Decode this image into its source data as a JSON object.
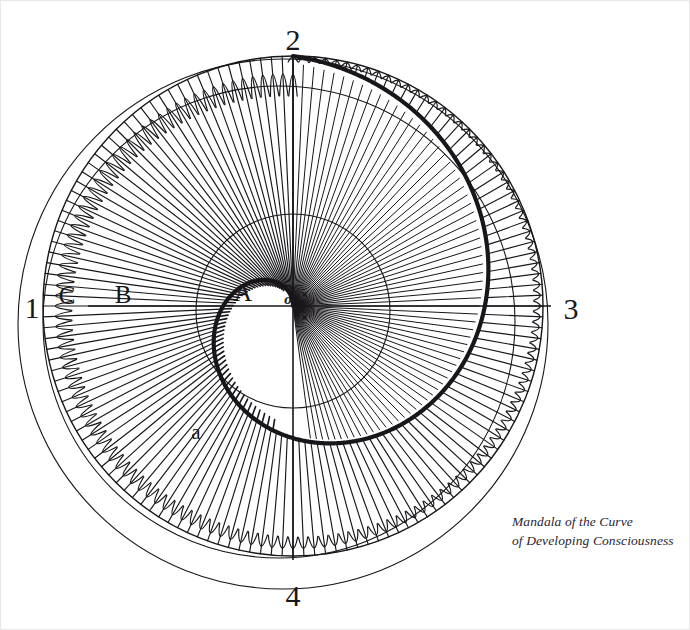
{
  "figure": {
    "title": "Mandala of the Curve of Developing Consciousness",
    "width": 690,
    "height": 630,
    "background_color": "#ffffff",
    "ink_color": "#18161a",
    "frame_color": "#e8e8e8"
  },
  "caption": {
    "line1": "Mandala of the Curve",
    "line2": "of Developing Consciousness"
  },
  "quadrant_labels": [
    {
      "key": "left",
      "text": "1",
      "x": 32,
      "y": 308
    },
    {
      "key": "top",
      "text": "2",
      "x": 293,
      "y": 40
    },
    {
      "key": "right",
      "text": "3",
      "x": 571,
      "y": 309
    },
    {
      "key": "bottom",
      "text": "4",
      "x": 293,
      "y": 596
    }
  ],
  "point_labels": [
    {
      "key": "C",
      "text": "C",
      "x": 67,
      "y": 295
    },
    {
      "key": "B",
      "text": "B",
      "x": 123,
      "y": 294
    },
    {
      "key": "A",
      "text": "A",
      "x": 243,
      "y": 292
    },
    {
      "key": "o",
      "text": "o",
      "x": 288,
      "y": 299
    },
    {
      "key": "a",
      "text": "a",
      "x": 196,
      "y": 432
    }
  ],
  "geometry": {
    "center": {
      "x": 293,
      "y": 306
    },
    "circles": [
      {
        "name": "inner-circle-A",
        "radius": 97,
        "stroke_width": 1.1
      },
      {
        "name": "petal-outer-circle",
        "radius": 250,
        "stroke_width": 1.4
      },
      {
        "name": "mid-outer-circle-C",
        "radius": 236,
        "stroke_width": 1.1,
        "offset_x": -14,
        "offset_y": 16
      },
      {
        "name": "outermost-circle-1",
        "radius": 265,
        "stroke_width": 1.1,
        "offset_x": -10,
        "offset_y": 18
      }
    ],
    "axes": {
      "horizontal": {
        "x1": 88,
        "y1": 306,
        "x2": 551,
        "y2": 306
      },
      "vertical": {
        "x1": 293,
        "y1": 57,
        "x2": 293,
        "y2": 560
      }
    },
    "spiral": {
      "name": "developing-consciousness-curve",
      "description": "Archimedean-style spiral from origin o growing outward counter-clockwise through points a, B, C toward quadrant 3",
      "turns": 1.0,
      "start_angle_deg": 90,
      "r_start": 0,
      "r_end": 250,
      "stroke_width": 4.2
    },
    "rays": {
      "name": "radial-rays",
      "count": 144,
      "inner_stop": "spiral radius at that angle",
      "outer_stop": 250,
      "stroke_width": 1.15
    },
    "petals": {
      "name": "petal-tips",
      "count": 144,
      "shape": "rounded cap at outer circle"
    }
  }
}
